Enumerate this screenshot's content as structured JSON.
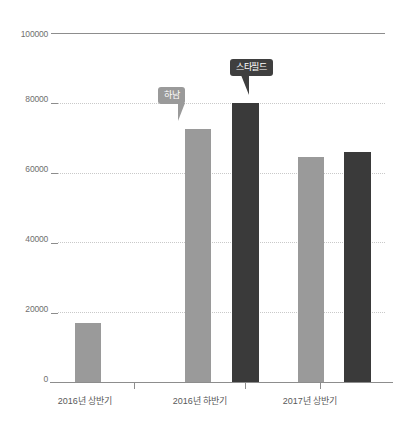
{
  "chart_data": {
    "type": "bar",
    "title": "",
    "subtitle": "",
    "xlabel": "",
    "ylabel": "",
    "categories": [
      "2016년 상반기",
      "2016년 하반기",
      "2017년 상반기"
    ],
    "series": [
      {
        "name": "하남",
        "color": "#9a9a9a",
        "values": [
          16800,
          72500,
          64500
        ]
      },
      {
        "name": "스타필드",
        "color": "#3a3a3a",
        "values": [
          null,
          80000,
          65800
        ]
      }
    ],
    "ylim": [
      0,
      100000
    ],
    "yticks": [
      0,
      20000,
      40000,
      60000,
      80000,
      100000
    ],
    "ytick_labels": [
      "0",
      "20000",
      "40000",
      "60000",
      "80000",
      "100000"
    ],
    "grid": true,
    "grid_style": "dotted",
    "legend": "none",
    "annotations": [
      {
        "text": "하남",
        "style": "light",
        "target_series": "하남",
        "target_category": "2016년 하반기"
      },
      {
        "text": "스타필드",
        "style": "dark",
        "target_series": "스타필드",
        "target_category": "2016년 하반기"
      }
    ]
  },
  "axis": {
    "y": {
      "t0": "0",
      "t1": "20000",
      "t2": "40000",
      "t3": "60000",
      "t4": "80000",
      "t5": "100000"
    },
    "x": {
      "c0": "2016년 상반기",
      "c1": "2016년 하반기",
      "c2": "2017년 상반기"
    }
  },
  "callouts": {
    "hanam": "하남",
    "starfield": "스타필드"
  },
  "colors": {
    "series_a": "#9a9a9a",
    "series_b": "#3a3a3a",
    "axis": "#8d8d8d",
    "grid": "#c9c9c9",
    "label": "#6f6f6f",
    "background": "#ffffff"
  }
}
